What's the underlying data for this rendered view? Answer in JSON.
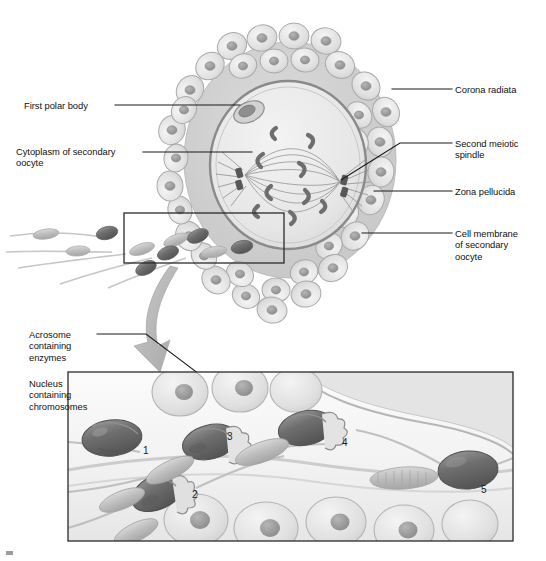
{
  "figure": {
    "type": "biological-illustration",
    "style": "grayscale halftone textbook illustration",
    "panels": [
      {
        "id": "upper",
        "name": "secondary-oocyte-overview",
        "description": "Secondary oocyte surrounded by corona radiata, with sperm approaching from the left; inset rectangle marks magnified region"
      },
      {
        "id": "lower",
        "name": "sperm-penetration-detail",
        "description": "Magnified boxed view showing five sequential stages of sperm penetrating the corona radiata and zona pellucida"
      }
    ]
  },
  "labels": {
    "left": [
      {
        "id": "first-polar-body",
        "text": "First polar body",
        "x": 24,
        "y": 100,
        "leader": [
          [
            115,
            105
          ],
          [
            228,
            105
          ]
        ]
      },
      {
        "id": "cytoplasm-of-secondary-oocyte",
        "text": "Cytoplasm of secondary\noocyte",
        "x": 16,
        "y": 146,
        "leader": [
          [
            143,
            152
          ],
          [
            246,
            152
          ]
        ]
      },
      {
        "id": "acrosome-containing-enzymes",
        "text": "Acrosome\ncontaining\nenzymes",
        "x": 29,
        "y": 329,
        "leader": [
          [
            97,
            334
          ],
          [
            143,
            334
          ],
          [
            290,
            441
          ]
        ]
      },
      {
        "id": "nucleus-containing-chromosomes",
        "text": "Nucleus\ncontaining\nchromosomes",
        "x": 29,
        "y": 378,
        "leader": [
          [
            80,
            383
          ],
          [
            115,
            383
          ],
          [
            258,
            452
          ]
        ]
      }
    ],
    "right": [
      {
        "id": "corona-radiata",
        "text": "Corona radiata",
        "x": 455,
        "y": 84,
        "leader": [
          [
            452,
            89
          ],
          [
            392,
            89
          ]
        ]
      },
      {
        "id": "second-meiotic-spindle",
        "text": "Second meiotic\nspindle",
        "x": 455,
        "y": 138,
        "leader": [
          [
            452,
            143
          ],
          [
            341,
            155
          ]
        ]
      },
      {
        "id": "zona-pellucida",
        "text": "Zona pellucida",
        "x": 455,
        "y": 186,
        "leader": [
          [
            452,
            191
          ],
          [
            380,
            191
          ]
        ]
      },
      {
        "id": "cell-membrane-of-secondary-oocyte",
        "text": "Cell membrane\nof secondary\noocyte",
        "x": 455,
        "y": 228,
        "leader": [
          [
            452,
            233
          ],
          [
            369,
            233
          ]
        ]
      }
    ]
  },
  "stage_numbers": [
    {
      "label": "1",
      "x": 143,
      "y": 445,
      "meaning": "intact sperm with acrosome"
    },
    {
      "label": "2",
      "x": 192,
      "y": 489,
      "meaning": "acrosome reaction begins"
    },
    {
      "label": "3",
      "x": 227,
      "y": 431,
      "meaning": "acrosomal enzymes released"
    },
    {
      "label": "4",
      "x": 342,
      "y": 437,
      "meaning": "sperm penetrating zona pellucida"
    },
    {
      "label": "5",
      "x": 481,
      "y": 484,
      "meaning": "sperm nucleus reaching oocyte membrane"
    }
  ],
  "inset_box": {
    "x": 124,
    "y": 213,
    "width": 160,
    "height": 50
  },
  "lower_panel_box": {
    "x": 68,
    "y": 372,
    "width": 445,
    "height": 169
  },
  "colors": {
    "ink": "#111111",
    "leader_line": "#1a1a1a",
    "background": "#ffffff",
    "corona_cell_fill": "#e2e2e2",
    "corona_cell_stroke": "#a9a9a9",
    "corona_nucleus": "#9a9a9a",
    "zona_pellucida": "#d4d4d4",
    "cell_membrane": "#8a8a8a",
    "cytoplasm": "#ededed",
    "spindle_fiber": "#8d8d8d",
    "chromosome": "#6f6f6f",
    "centriole": "#5a5a5a",
    "sperm_head_dark": "#6d6d6d",
    "sperm_head_light": "#b4b4b4",
    "sperm_tail": "#bdbdbd",
    "arrow_gray": "#b9b9b9"
  }
}
